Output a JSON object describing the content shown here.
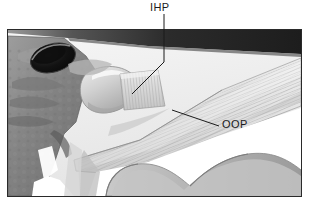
{
  "figure": {
    "kind": "anatomical-illustration",
    "view": "lateral-medial cutaway, grayscale line-and-tone drawing",
    "background_color": "#ffffff",
    "frame": {
      "border_color": "#2a2a2a",
      "border_width_px": 1,
      "x": 7,
      "y": 29,
      "width": 295,
      "height": 168,
      "fill_color": "#f2f2f2"
    }
  },
  "labels": [
    {
      "id": "ihp",
      "text": "IHP",
      "meaning": "inferior head of lateral pterygoid",
      "x": 150,
      "y": 2,
      "color": "#1b1b1b",
      "leader": {
        "description": "vertical stem down from label, then oblique segment down-left into the striated muscle belly",
        "points": [
          [
            164,
            14
          ],
          [
            164,
            62
          ],
          [
            132,
            94
          ]
        ],
        "color": "#1b1b1b",
        "width_px": 1
      }
    },
    {
      "id": "oop",
      "text": "OOP",
      "meaning": "outer oblique portion",
      "x": 222,
      "y": 119,
      "color": "#1b1b1b",
      "leader": {
        "description": "single oblique segment running up-left from label into the fanned fiber sheet",
        "points": [
          [
            219,
            126
          ],
          [
            172,
            110
          ]
        ],
        "color": "#1b1b1b",
        "width_px": 1
      }
    }
  ],
  "palette": {
    "ink": "#1b1b1b",
    "frame_border": "#2a2a2a",
    "paper": "#ffffff",
    "field_light": "#f0f0f0",
    "bone_light": "#d9d9d9",
    "bone_mid": "#b8b8b8",
    "bone_dark": "#8f8f8f",
    "bone_darker": "#6e6e6e",
    "shadow": "#4a4a4a",
    "deep_shadow": "#232323",
    "foramen": "#141414",
    "muscle_light": "#e2e2e2",
    "muscle_mid": "#c6c6c6",
    "muscle_stripe": "#a5a5a5",
    "highlight": "#fbfbfb"
  },
  "structures": [
    {
      "id": "upper-dark-wedge",
      "name": "superior dark band (skull base / zygomatic shadow)",
      "tone": "#232323",
      "note": "wedge across the top, thick at right, tapering to a point toward the left"
    },
    {
      "id": "foramen",
      "name": "dark oval foramen opening",
      "tone": "#141414",
      "note": "ellipse at upper-left, rotated, with rim highlight"
    },
    {
      "id": "pterygoid-plate",
      "name": "pterygoid plate / skull bone mass",
      "tone": "#8f8f8f",
      "note": "mottled bone block occupying the left third"
    },
    {
      "id": "condyle",
      "name": "mandibular condyle head",
      "tone": "#cfcfcf",
      "note": "rounded knob at center-left of the joint"
    },
    {
      "id": "ihp-muscle",
      "name": "inferior head of lateral pterygoid (striated belly)",
      "tone": "#d8d8d8",
      "note": "short parallel-striated bundle just right of the condyle"
    },
    {
      "id": "oop-fibers",
      "name": "outer oblique portion fiber fan",
      "tone": "#dcdcdc",
      "note": "broad fan of fine parallel striations sweeping from upper-right down to lower-left"
    },
    {
      "id": "ramus",
      "name": "mandibular ramus with sigmoid (mandibular) notch",
      "tone": "#ffffff",
      "note": "white concave notch at lower right bounded by grey cortical edges"
    },
    {
      "id": "lower-left-void",
      "name": "white background gap below the skull bone",
      "tone": "#ffffff",
      "note": "bright negative space at lower left"
    }
  ],
  "annotations": {
    "stripe_direction_oop": "approx -22 degrees from horizontal, fibers converge toward lower-left insertion",
    "stripe_direction_ihp": "approx -8 degrees, short horizontal-running bundle",
    "line_style": "thin 1px black leader lines, no arrowheads"
  }
}
